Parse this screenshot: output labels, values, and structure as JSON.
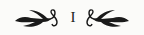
{
  "heading": {
    "numeral": "I",
    "left_ornament": "fleuron-left-icon",
    "right_ornament": "fleuron-right-icon"
  },
  "colors": {
    "ink": "#1a1a1a",
    "background": "#fbfbf9"
  }
}
